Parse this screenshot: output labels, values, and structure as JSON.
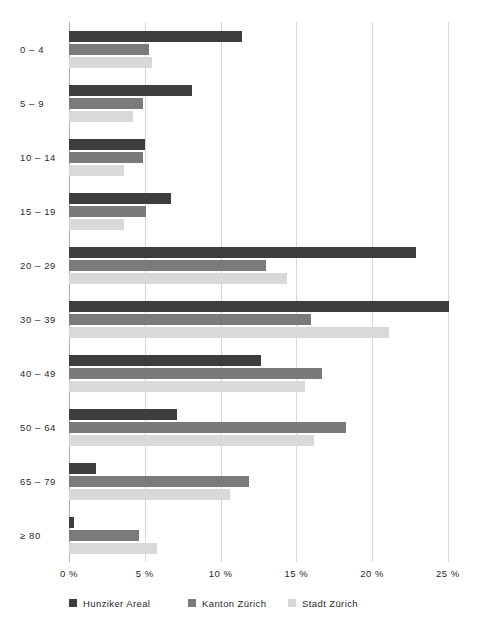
{
  "chart_data": {
    "type": "bar",
    "orientation": "horizontal",
    "title": "",
    "subtitle": "",
    "xlabel": "",
    "ylabel": "",
    "categories": [
      "0 – 4",
      "5 – 9",
      "10 – 14",
      "15 – 19",
      "20 – 29",
      "30 – 39",
      "40 – 49",
      "50 – 64",
      "65 – 79",
      "≥ 80"
    ],
    "series": [
      {
        "name": "Hunziker Areal",
        "color": "#3d3d3d",
        "values": [
          11.4,
          8.1,
          5.0,
          6.7,
          22.9,
          25.1,
          12.7,
          7.1,
          1.8,
          0.3
        ]
      },
      {
        "name": "Kanton Zürich",
        "color": "#7a7a7a",
        "values": [
          5.3,
          4.9,
          4.9,
          5.1,
          13.0,
          16.0,
          16.7,
          18.3,
          11.9,
          4.6
        ]
      },
      {
        "name": "Stadt Zürich",
        "color": "#d9d9d9",
        "values": [
          5.5,
          4.2,
          3.6,
          3.6,
          14.4,
          21.1,
          15.6,
          16.2,
          10.6,
          5.8
        ]
      }
    ],
    "xticks": [
      0,
      5,
      10,
      15,
      20,
      25
    ],
    "xtick_labels": [
      "0 %",
      "5 %",
      "10 %",
      "15 %",
      "20 %",
      "25 %"
    ],
    "xlim": [
      0,
      26
    ],
    "grid": true,
    "grid_axis": "x",
    "legend_position": "bottom",
    "value_unit": "%"
  },
  "legend": {
    "items": [
      {
        "label": "Hunziker Areal"
      },
      {
        "label": "Kanton Zürich"
      },
      {
        "label": "Stadt Zürich"
      }
    ]
  }
}
